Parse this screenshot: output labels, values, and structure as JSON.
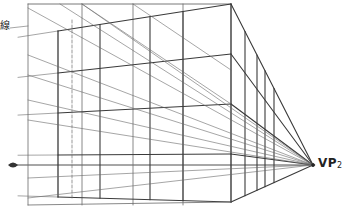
{
  "diagram": {
    "type": "two-point perspective construction (building box)",
    "labels": {
      "horizon_label": "線",
      "vp_main": "VP",
      "vp_sub": "2"
    },
    "vanishing_point": {
      "name": "VP2",
      "x": 313,
      "y": 165
    },
    "horizon": {
      "y": 165,
      "x_start": 14,
      "x_end": 313
    },
    "eye_symbol": {
      "x": 13,
      "y": 165
    },
    "colors": {
      "line": "#3a3a3a",
      "light_line": "#6a6a6a",
      "background": "#ffffff"
    },
    "outer_frame": {
      "left": 28,
      "top": 4,
      "bottom": 205,
      "verticals_x": [
        28,
        82,
        133,
        183,
        231
      ]
    },
    "front_corner": {
      "x": 231,
      "top": 4,
      "bottom": 202
    },
    "near_face_left_edge": {
      "x": 58,
      "top": 31,
      "bottom": 197
    },
    "dashed_vertical_x": 72,
    "side_face_verticals_x": [
      245,
      257,
      265,
      274
    ],
    "horizontal_floor_levels_at_corner_y": [
      4,
      54,
      104,
      154,
      202
    ]
  }
}
